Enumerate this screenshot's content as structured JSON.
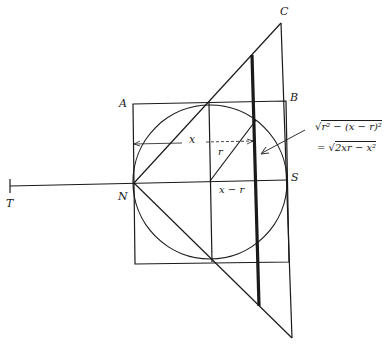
{
  "diagram": {
    "type": "geometry",
    "points": {
      "A": {
        "label": "A",
        "x": 133,
        "y": 104
      },
      "B": {
        "label": "B",
        "x": 286,
        "y": 101
      },
      "C": {
        "label": "C",
        "x": 281,
        "y": 23
      },
      "N": {
        "label": "N",
        "x": 134,
        "y": 183
      },
      "S": {
        "label": "S",
        "x": 287,
        "y": 180
      },
      "T": {
        "label": "T",
        "x": 10,
        "y": 186
      }
    },
    "circle": {
      "cx": 210,
      "cy": 182,
      "r": 77
    },
    "labels": {
      "A": "A",
      "B": "B",
      "C": "C",
      "N": "N",
      "S": "S",
      "T": "T",
      "x": "x",
      "r": "r",
      "x_minus_r": "x − r"
    },
    "formula": {
      "line1_radicand": "r² − (x − r)²",
      "line2_prefix": "=",
      "line2_radicand": "2xr − x²",
      "sqrt_symbol": "√"
    },
    "colors": {
      "ink": "#1a1a1a",
      "background": "#ffffff"
    }
  }
}
